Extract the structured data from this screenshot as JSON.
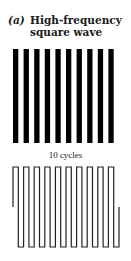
{
  "figure": {
    "label": "(a)",
    "title_line1": "High-frequency",
    "title_line2": "square wave",
    "caption": "10 cycles",
    "cycles": 10,
    "bar_color": "#000000",
    "wave_color": "#222222"
  }
}
